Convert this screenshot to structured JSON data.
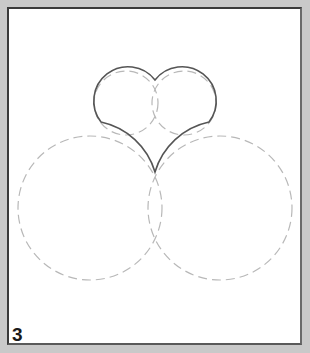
{
  "figure": {
    "step_number": "3",
    "colors": {
      "background_outer": "#c9c9c9",
      "canvas": "#ffffff",
      "heart_stroke": "#555555",
      "guide_stroke": "#b5b5b5"
    },
    "shapes": {
      "heart": {
        "type": "solid-outline",
        "point": [
          155,
          172
        ],
        "notch": [
          155,
          80
        ]
      },
      "lobe_circles": [
        {
          "cx": 126,
          "cy": 103,
          "r": 32,
          "style": "dashed"
        },
        {
          "cx": 184,
          "cy": 103,
          "r": 32,
          "style": "dashed"
        }
      ],
      "construction_circles": [
        {
          "cx": 90,
          "cy": 208,
          "r": 72,
          "style": "dashed"
        },
        {
          "cx": 220,
          "cy": 208,
          "r": 72,
          "style": "dashed"
        }
      ]
    }
  }
}
